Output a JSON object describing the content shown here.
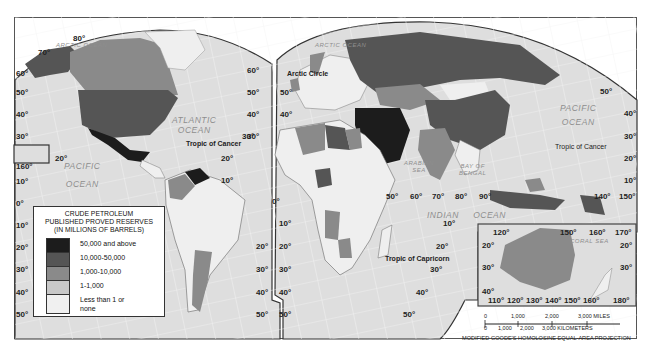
{
  "map": {
    "projection_label": "MODIFIED GOODE'S HOMOLOSINE EQUAL-AREA PROJECTION",
    "oceans": {
      "arctic_west": "ARCTIC OCEAN",
      "arctic_east": "ARCTIC OCEAN",
      "atlantic": [
        "ATLANTIC",
        "OCEAN"
      ],
      "pacific_west": [
        "PACIFIC",
        "OCEAN"
      ],
      "pacific_east": [
        "PACIFIC",
        "OCEAN"
      ],
      "indian": [
        "INDIAN",
        "OCEAN"
      ],
      "arabian_sea": [
        "ARABIAN",
        "SEA"
      ],
      "bay_of_bengal": [
        "BAY OF",
        "BENGAL"
      ],
      "coral_sea": "CORAL SEA"
    },
    "lines": {
      "arctic_circle": "Arctic Circle",
      "tropic_cancer_w": "Tropic of Cancer",
      "tropic_cancer_e": "Tropic of Cancer",
      "tropic_capricorn": "Tropic of Capricorn"
    },
    "lat_labels_left": [
      "70°",
      "60°",
      "50°",
      "40°",
      "30°",
      "20°",
      "10°",
      "0°",
      "10°",
      "20°",
      "30°",
      "40°",
      "50°"
    ],
    "lat_labels_americas": [
      "60°",
      "50°",
      "40°",
      "30°",
      "20°",
      "10°"
    ],
    "lat_labels_americas_south": [
      "20°",
      "30°",
      "40°",
      "50°"
    ],
    "lat_labels_africa": [
      "50°",
      "40°",
      "30°",
      "0°",
      "10°",
      "20°",
      "30°",
      "40°",
      "50°"
    ],
    "lat_labels_east": [
      "50°",
      "40°",
      "30°",
      "20°",
      "10°"
    ],
    "lat_labels_indian": [
      "10°",
      "20°",
      "30°",
      "40°",
      "50°"
    ],
    "lon_labels_asia": [
      "50°",
      "60°",
      "70°",
      "80°",
      "90°",
      "140°",
      "150°"
    ],
    "inset_hawaii": {
      "lat": "20°",
      "lon": "160°"
    },
    "inset_australia": {
      "top_lon": [
        "120°",
        "150°",
        "160°",
        "170°"
      ],
      "bottom_lon": [
        "110°",
        "120°",
        "130°",
        "140°",
        "150°",
        "160°",
        "180°"
      ],
      "lat_left": [
        "20°",
        "30°",
        "40°"
      ],
      "lat_right": [
        "20°",
        "30°"
      ]
    },
    "top_labels": {
      "n80": "80°",
      "n70": "70°"
    }
  },
  "legend": {
    "title": [
      "CRUDE PETROLEUM",
      "PUBLISHED PROVED RESERVES",
      "(IN MILLIONS OF BARRELS)"
    ],
    "items": [
      {
        "label": "50,000 and above",
        "color": "#1c1c1c"
      },
      {
        "label": "10,000-50,000",
        "color": "#555555"
      },
      {
        "label": "1,000-10,000",
        "color": "#8a8a8a"
      },
      {
        "label": "1-1,000",
        "color": "#c8c8c8"
      },
      {
        "label": "Less than 1 or none",
        "color": "#f0f0f0"
      }
    ]
  },
  "scale": {
    "miles": [
      "0",
      "1,000",
      "2,000",
      "3,000 MILES"
    ],
    "km": [
      "0",
      "1,000",
      "2,000",
      "3,000 KILOMETERS"
    ]
  },
  "colors": {
    "ocean": "#dedede",
    "graticule": "#f7f7f7",
    "border": "#444444"
  }
}
